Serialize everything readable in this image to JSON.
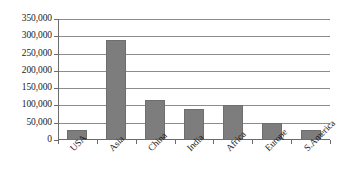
{
  "chart_data": {
    "type": "bar",
    "title": "",
    "subtitle": "",
    "xlabel": "",
    "ylabel": "",
    "categories": [
      "USA",
      "Asia",
      "China",
      "India",
      "Africa",
      "Europe",
      "S.America"
    ],
    "values": [
      30000,
      290000,
      115000,
      90000,
      100000,
      50000,
      30000
    ],
    "series": [
      {
        "name": "Series 1",
        "values": [
          30000,
          290000,
          115000,
          90000,
          100000,
          50000,
          30000
        ]
      }
    ],
    "ylim": [
      0,
      350000
    ],
    "ytick_values": [
      0,
      50000,
      100000,
      150000,
      200000,
      250000,
      300000,
      350000
    ],
    "ytick_labels": [
      "0",
      "50,000",
      "100,000",
      "150,000",
      "200,000",
      "250,000",
      "300,000",
      "350,000"
    ],
    "grid": true,
    "grid_axis": "y",
    "legend": false,
    "legend_position": "none",
    "bar_color": "#7d7d7d",
    "bar_border_color": "#6e6e6e",
    "axis_color": "#6b6b6b",
    "gridline_color": "#8c8c8c",
    "background_color": "#ffffff",
    "text_color": "#1a1a1a",
    "xtick_label_rotation": -45,
    "annotations": []
  }
}
